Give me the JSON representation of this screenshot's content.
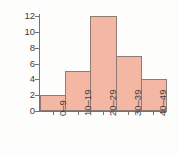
{
  "chart_data": {
    "type": "bar",
    "title": "",
    "subtitle": "",
    "xlabel": "",
    "ylabel": "Frequency",
    "categories": [
      "0–9",
      "10–19",
      "20–29",
      "30–39",
      "40–49"
    ],
    "values": [
      2,
      5,
      12,
      7,
      4
    ],
    "series": [
      {
        "name": "Frequency",
        "values": [
          2,
          5,
          12,
          7,
          4
        ]
      }
    ],
    "ylim": [
      0,
      12
    ],
    "ytick_labels": [
      "0",
      "2",
      "4",
      "6",
      "8",
      "10",
      "12"
    ],
    "ytick_values": [
      0,
      2,
      4,
      6,
      8,
      10,
      12
    ],
    "grid": false,
    "legend": false,
    "legend_position": "none",
    "bar_fill_color": "#f4b7a3",
    "bar_border_color": "#8d7c76",
    "axis_color": "#78736f",
    "text_color": "#3d3d3d",
    "background_color": "#fdfdfc",
    "xtick_label_rotation": -90
  }
}
